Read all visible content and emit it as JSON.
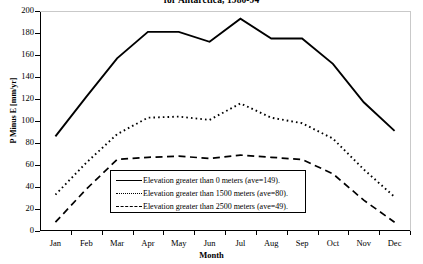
{
  "chart_data": {
    "type": "line",
    "title": "for Antarctica, 1980-94",
    "xlabel": "Month",
    "ylabel": "P Minus E [mm/yr]",
    "categories": [
      "Jan",
      "Feb",
      "Mar",
      "Apr",
      "May",
      "Jun",
      "Jul",
      "Aug",
      "Sep",
      "Oct",
      "Nov",
      "Dec"
    ],
    "ylim": [
      0,
      200
    ],
    "yticks": [
      0,
      20,
      40,
      60,
      80,
      100,
      120,
      140,
      160,
      180,
      200
    ],
    "grid": false,
    "legend_position": "inside-bottom-center",
    "series": [
      {
        "name": "Elevation greater than 0 meters (ave=149).",
        "style": "solid",
        "average": 149,
        "values": [
          86,
          122,
          157,
          181,
          181,
          172,
          193,
          175,
          175,
          152,
          117,
          91
        ]
      },
      {
        "name": "Elevation greater than 1500 meters (ave=80).",
        "style": "dotted",
        "average": 80,
        "values": [
          33,
          62,
          88,
          103,
          104,
          101,
          116,
          103,
          98,
          84,
          56,
          31
        ]
      },
      {
        "name": "Elevation greater than 2500 meters (ave=49).",
        "style": "dashed",
        "average": 49,
        "values": [
          8,
          38,
          65,
          67,
          68,
          66,
          69,
          67,
          65,
          52,
          28,
          8
        ]
      }
    ]
  },
  "axes": {
    "y_tick_labels": [
      "200",
      "180",
      "160",
      "140",
      "120",
      "100",
      "80",
      "60",
      "40",
      "20",
      "0"
    ],
    "x_tick_labels": [
      "Jan",
      "Feb",
      "Mar",
      "Apr",
      "May",
      "Jun",
      "Jul",
      "Aug",
      "Sep",
      "Oct",
      "Nov",
      "Dec"
    ]
  },
  "legend": {
    "rows": [
      {
        "key": "solid-line-key",
        "label": "Elevation greater than 0 meters (ave=149)."
      },
      {
        "key": "dotted-line-key",
        "label": "Elevation greater than 1500 meters (ave=80)."
      },
      {
        "key": "dashed-line-key",
        "label": "Elevation greater than 2500 meters (ave=49)."
      }
    ]
  },
  "colors": {
    "line": "#000000",
    "axis": "#000000",
    "frame_light": "#c9c9c9",
    "background": "#ffffff"
  }
}
